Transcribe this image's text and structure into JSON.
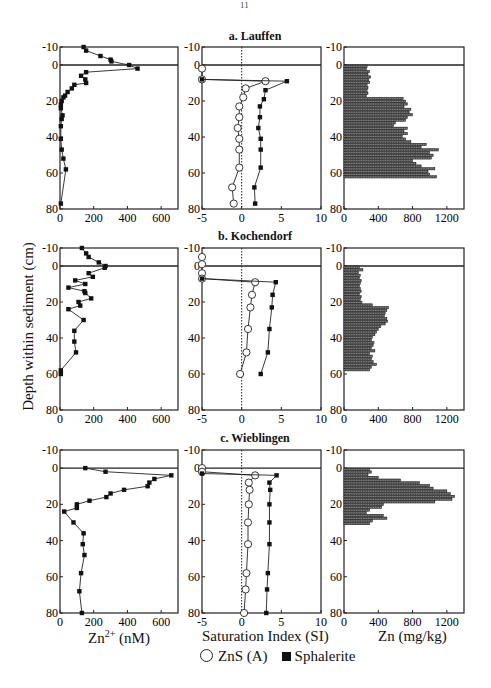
{
  "page_mark": "11",
  "ylabel": "Depth within sediment (cm)",
  "xlabels": {
    "zn2": "Zn2+ (nM)",
    "si": "Saturation Index (SI)",
    "zn_solid": "Zn (mg/kg)"
  },
  "legend": {
    "open_circle": "ZnS (A)",
    "filled_square": "Sphalerite"
  },
  "sites": [
    {
      "key": "a",
      "title": "a. Lauffen"
    },
    {
      "key": "b",
      "title": "b. Kochendorf"
    },
    {
      "key": "c",
      "title": "c. Wieblingen"
    }
  ],
  "chart_data": [
    {
      "type": "line",
      "title": "a. Lauffen — dissolved Zn2+",
      "xlabel": "Zn2+ (nM)",
      "ylabel": "Depth within sediment (cm)",
      "xlim": [
        0,
        700
      ],
      "ylim": [
        80,
        -10
      ],
      "xticks": [
        0,
        200,
        400,
        600
      ],
      "yticks": [
        -10,
        0,
        20,
        40,
        60,
        80
      ],
      "series": [
        {
          "name": "Zn2+",
          "marker": "filled_square",
          "x": [
            140,
            155,
            240,
            300,
            305,
            410,
            460,
            155,
            125,
            150,
            155,
            85,
            70,
            45,
            30,
            20,
            10,
            5,
            5,
            15,
            10,
            5,
            5,
            10,
            20,
            35,
            5
          ],
          "y": [
            -10,
            -8,
            -5,
            -3,
            -2,
            0,
            2,
            4,
            6,
            8,
            10,
            11,
            13,
            15,
            17,
            18,
            20,
            22,
            24,
            28,
            30,
            34,
            41,
            47,
            52,
            58,
            77
          ]
        }
      ]
    },
    {
      "type": "line",
      "title": "a. Lauffen — saturation index",
      "xlabel": "Saturation Index (SI)",
      "xlim": [
        -5,
        10
      ],
      "ylim": [
        80,
        -10
      ],
      "xticks": [
        -5,
        0,
        5,
        10
      ],
      "yticks": [
        -10,
        0,
        20,
        40,
        60,
        80
      ],
      "series": [
        {
          "name": "ZnS (A)",
          "marker": "open_circle",
          "x": [
            -5,
            -5,
            3,
            0.5,
            0.2,
            -0.3,
            -0.3,
            -0.5,
            -0.3,
            -0.3,
            -0.3,
            -1.2,
            -1
          ],
          "y": [
            2,
            8,
            9,
            13,
            18,
            23,
            29,
            35,
            41,
            47,
            57,
            68,
            77
          ]
        },
        {
          "name": "Sphalerite",
          "marker": "filled_square",
          "x": [
            -5,
            5.7,
            3,
            2.8,
            2.3,
            2.3,
            2.1,
            2.4,
            2.4,
            2.4,
            1.6,
            1.7
          ],
          "y": [
            8,
            9,
            14,
            19,
            23,
            29,
            35,
            41,
            47,
            57,
            68,
            77
          ]
        }
      ],
      "reference_line": {
        "x": 0,
        "style": "dotted"
      }
    },
    {
      "type": "bar",
      "orientation": "horizontal",
      "title": "a. Lauffen — sediment Zn",
      "xlabel": "Zn (mg/kg)",
      "xlim": [
        0,
        1400
      ],
      "ylim": [
        80,
        -10
      ],
      "xticks": [
        0,
        400,
        800,
        1200
      ],
      "yticks": [
        -10,
        0,
        20,
        40,
        60,
        80
      ],
      "depth_step_cm": 1.5,
      "depths": [
        0.75,
        2.25,
        3.75,
        5.25,
        6.75,
        8.25,
        9.75,
        11.25,
        12.75,
        14.25,
        15.75,
        17.25,
        18.75,
        20.25,
        21.75,
        23.25,
        24.75,
        26.25,
        27.75,
        29.25,
        30.75,
        32.25,
        33.75,
        35.25,
        36.75,
        38.25,
        39.75,
        41.25,
        42.75,
        44.25,
        45.75,
        47.25,
        48.75,
        50.25,
        51.75,
        53.25,
        54.75,
        56.25,
        57.75,
        59.25,
        60.75,
        62.25
      ],
      "values": [
        270,
        260,
        300,
        280,
        310,
        290,
        300,
        270,
        280,
        270,
        280,
        260,
        690,
        720,
        740,
        700,
        780,
        760,
        800,
        740,
        720,
        600,
        580,
        740,
        700,
        740,
        680,
        720,
        780,
        960,
        900,
        1100,
        1000,
        1040,
        1020,
        800,
        840,
        900,
        1060,
        980,
        1000,
        1080
      ]
    },
    {
      "type": "line",
      "title": "b. Kochendorf — dissolved Zn2+",
      "xlabel": "Zn2+ (nM)",
      "xlim": [
        0,
        700
      ],
      "ylim": [
        80,
        -10
      ],
      "xticks": [
        0,
        200,
        400,
        600
      ],
      "yticks": [
        -10,
        0,
        20,
        40,
        60,
        80
      ],
      "series": [
        {
          "name": "Zn2+",
          "marker": "filled_square",
          "x": [
            130,
            155,
            170,
            230,
            270,
            265,
            170,
            195,
            90,
            150,
            50,
            145,
            150,
            185,
            110,
            120,
            50,
            140,
            85,
            85,
            95,
            5,
            5
          ],
          "y": [
            -10,
            -7,
            -5,
            -2,
            0,
            1,
            4,
            6,
            8,
            10,
            12,
            14,
            15,
            18,
            20,
            22,
            24,
            30,
            36,
            42,
            48,
            58,
            60
          ]
        }
      ]
    },
    {
      "type": "line",
      "title": "b. Kochendorf — saturation index",
      "xlabel": "Saturation Index (SI)",
      "xlim": [
        -5,
        10
      ],
      "ylim": [
        80,
        -10
      ],
      "xticks": [
        -5,
        0,
        5,
        10
      ],
      "yticks": [
        -10,
        0,
        20,
        40,
        60,
        80
      ],
      "series": [
        {
          "name": "ZnS (A)",
          "marker": "open_circle",
          "x": [
            -5,
            -5,
            -5,
            -5,
            1.7,
            1.3,
            1.1,
            0.8,
            0.6,
            -0.2
          ],
          "y": [
            -5,
            -1,
            4,
            7,
            9,
            16,
            23,
            35,
            48,
            60
          ]
        },
        {
          "name": "Sphalerite",
          "marker": "filled_square",
          "x": [
            -5,
            4.3,
            3.9,
            3.8,
            3.5,
            3.3,
            2.4
          ],
          "y": [
            7,
            9,
            16,
            23,
            35,
            48,
            60
          ]
        }
      ],
      "reference_line": {
        "x": 0,
        "style": "dotted"
      }
    },
    {
      "type": "bar",
      "orientation": "horizontal",
      "title": "b. Kochendorf — sediment Zn",
      "xlabel": "Zn (mg/kg)",
      "xlim": [
        0,
        1400
      ],
      "ylim": [
        80,
        -10
      ],
      "xticks": [
        0,
        400,
        800,
        1200
      ],
      "yticks": [
        -10,
        0,
        20,
        40,
        60,
        80
      ],
      "depth_step_cm": 1.5,
      "depths": [
        0.75,
        2.25,
        3.75,
        5.25,
        6.75,
        8.25,
        9.75,
        11.25,
        12.75,
        14.25,
        15.75,
        17.25,
        18.75,
        20.25,
        21.75,
        23.25,
        24.75,
        26.25,
        27.75,
        29.25,
        30.75,
        32.25,
        33.75,
        35.25,
        36.75,
        38.25,
        39.75,
        41.25,
        42.75,
        44.25,
        45.75,
        47.25,
        48.75,
        50.25,
        51.75,
        53.25,
        54.75,
        56.25,
        57.75
      ],
      "values": [
        180,
        220,
        170,
        190,
        180,
        200,
        190,
        180,
        190,
        200,
        180,
        200,
        190,
        210,
        330,
        520,
        500,
        480,
        470,
        500,
        510,
        480,
        430,
        400,
        380,
        360,
        330,
        320,
        350,
        340,
        320,
        360,
        300,
        330,
        320,
        340,
        380,
        320,
        300
      ]
    },
    {
      "type": "line",
      "title": "c. Wieblingen — dissolved Zn2+",
      "xlabel": "Zn2+ (nM)",
      "xlim": [
        0,
        700
      ],
      "ylim": [
        80,
        -10
      ],
      "xticks": [
        0,
        200,
        400,
        600
      ],
      "yticks": [
        -10,
        0,
        20,
        40,
        60,
        80
      ],
      "series": [
        {
          "name": "Zn2+",
          "marker": "filled_square",
          "x": [
            150,
            270,
            660,
            560,
            530,
            520,
            380,
            300,
            275,
            175,
            100,
            100,
            25,
            80,
            140,
            135,
            145,
            125,
            115,
            130
          ],
          "y": [
            0,
            2,
            4,
            6,
            8,
            10,
            12,
            14,
            16,
            18,
            20,
            22,
            24,
            30,
            36,
            42,
            48,
            58,
            68,
            80
          ]
        }
      ]
    },
    {
      "type": "line",
      "title": "c. Wieblingen — saturation index",
      "xlabel": "Saturation Index (SI)",
      "xlim": [
        -5,
        10
      ],
      "ylim": [
        80,
        -10
      ],
      "xticks": [
        -5,
        0,
        5,
        10
      ],
      "yticks": [
        -10,
        0,
        20,
        40,
        60,
        80
      ],
      "series": [
        {
          "name": "ZnS (A)",
          "marker": "open_circle",
          "x": [
            -5,
            -5,
            1.7,
            0.9,
            1.0,
            0.9,
            0.8,
            0.8,
            0.6,
            0.5,
            0.3
          ],
          "y": [
            0,
            2,
            4,
            8,
            12,
            20,
            30,
            42,
            58,
            67,
            80
          ]
        },
        {
          "name": "Sphalerite",
          "marker": "filled_square",
          "x": [
            -5,
            4.4,
            3.5,
            3.6,
            3.5,
            3.5,
            3.5,
            3.3,
            3.2,
            3.1
          ],
          "y": [
            3,
            4,
            8,
            12,
            20,
            30,
            42,
            58,
            67,
            80
          ]
        }
      ],
      "reference_line": {
        "x": 0,
        "style": "dotted"
      }
    },
    {
      "type": "bar",
      "orientation": "horizontal",
      "title": "c. Wieblingen — sediment Zn",
      "xlabel": "Zn (mg/kg)",
      "xlim": [
        0,
        1400
      ],
      "ylim": [
        80,
        -10
      ],
      "xticks": [
        0,
        400,
        800,
        1200
      ],
      "yticks": [
        -10,
        0,
        20,
        40,
        60,
        80
      ],
      "depth_step_cm": 1.5,
      "depths": [
        0.75,
        2.25,
        3.75,
        5.25,
        6.75,
        8.25,
        9.75,
        11.25,
        12.75,
        14.25,
        15.75,
        17.25,
        18.75,
        20.25,
        21.75,
        23.25,
        24.75,
        26.25,
        27.75,
        29.25,
        30.75
      ],
      "values": [
        300,
        320,
        280,
        400,
        660,
        880,
        1000,
        1040,
        1200,
        1240,
        1290,
        1260,
        1060,
        460,
        440,
        300,
        260,
        460,
        500,
        330,
        300
      ]
    }
  ]
}
